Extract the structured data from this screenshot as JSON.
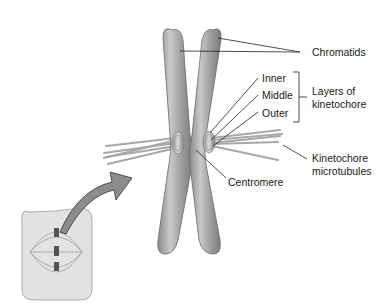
{
  "labels": {
    "chromatids": "Chromatids",
    "inner": "Inner",
    "middle": "Middle",
    "outer": "Outer",
    "layers_line1": "Layers of",
    "layers_line2": "kinetochore",
    "microtubules_line1": "Kinetochore",
    "microtubules_line2": "microtubules",
    "centromere": "Centromere"
  },
  "colors": {
    "chromatid": "#8f8f8f",
    "chromatid_highlight": "#c4c4c4",
    "inset_bg": "#e2e2e2",
    "arrow": "#8a8a8a",
    "line": "#222222"
  }
}
